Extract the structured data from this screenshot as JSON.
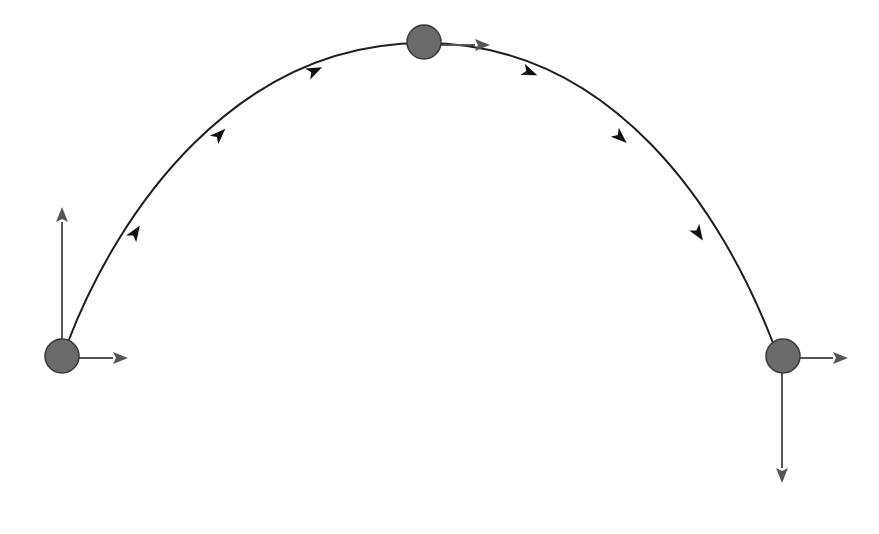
{
  "diagram": {
    "type": "projectile-motion-trajectory",
    "colors": {
      "trajectory": "#1e1e1e",
      "vectors": "#555555",
      "ball_fill": "#6a6a6a",
      "ball_stroke": "#3a3a3a",
      "background": "#ffffff"
    },
    "trajectory": {
      "start": [
        68,
        342
      ],
      "apex": [
        424,
        43
      ],
      "end": [
        773,
        343
      ],
      "direction_markers": [
        {
          "x": 135,
          "y": 233,
          "angle": -57
        },
        {
          "x": 219,
          "y": 135,
          "angle": -45
        },
        {
          "x": 314,
          "y": 71,
          "angle": -25
        },
        {
          "x": 529,
          "y": 72,
          "angle": 22
        },
        {
          "x": 620,
          "y": 137,
          "angle": 42
        },
        {
          "x": 698,
          "y": 233,
          "angle": 57
        }
      ]
    },
    "objects": [
      {
        "name": "launch-position",
        "center": [
          62,
          356
        ],
        "radius": 17,
        "vectors": [
          {
            "component": "vertical-velocity-up",
            "from": [
              62,
              339
            ],
            "to": [
              62,
              207
            ]
          },
          {
            "component": "horizontal-velocity",
            "from": [
              79,
              358
            ],
            "to": [
              128,
              358
            ]
          }
        ]
      },
      {
        "name": "apex-position",
        "center": [
          424,
          42
        ],
        "radius": 17,
        "vectors": [
          {
            "component": "horizontal-velocity",
            "from": [
              441,
              45
            ],
            "to": [
              490,
              45
            ]
          }
        ]
      },
      {
        "name": "landing-position",
        "center": [
          783,
          356
        ],
        "radius": 17,
        "vectors": [
          {
            "component": "horizontal-velocity",
            "from": [
              800,
              358
            ],
            "to": [
              848,
              358
            ]
          },
          {
            "component": "vertical-velocity-down",
            "from": [
              782,
              373
            ],
            "to": [
              782,
              483
            ]
          }
        ]
      }
    ]
  }
}
